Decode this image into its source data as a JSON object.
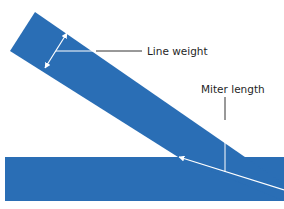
{
  "diagram": {
    "labels": {
      "line_weight": "Line weight",
      "miter_length": "Miter length"
    },
    "colors": {
      "stroke_fill": "#2a6eb5",
      "annotation_arrow": "#ffffff",
      "leader_line": "#333333",
      "text": "#1f1f1f",
      "background": "#ffffff"
    }
  }
}
